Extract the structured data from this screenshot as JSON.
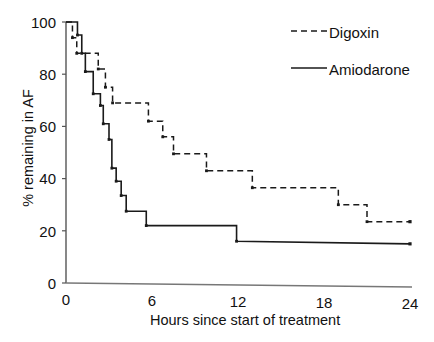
{
  "chart_data": {
    "type": "line",
    "subtype": "step-kaplan-meier",
    "title": "",
    "xlabel": "Hours since start of treatment",
    "ylabel": "% remaining in AF",
    "xlim": [
      0,
      24
    ],
    "ylim": [
      0,
      100
    ],
    "xticks": [
      0,
      6,
      12,
      18,
      24
    ],
    "xtick_labels": [
      "0",
      "6",
      "12",
      "18",
      "24"
    ],
    "yticks": [
      0,
      20,
      40,
      60,
      80,
      100
    ],
    "ytick_labels": [
      "0",
      "20",
      "40",
      "60",
      "80",
      "100"
    ],
    "grid": false,
    "legend_position": "top-right",
    "series": [
      {
        "name": "Digoxin",
        "style": "dashed",
        "color": "#1a1a1a",
        "x": [
          0.0,
          0.45,
          0.45,
          0.75,
          0.75,
          2.25,
          2.25,
          2.75,
          2.75,
          3.25,
          3.25,
          5.75,
          5.75,
          6.75,
          6.75,
          7.5,
          7.5,
          9.8,
          9.8,
          13.0,
          13.0,
          19.0,
          19.0,
          21.0,
          21.0,
          24.0
        ],
        "y": [
          100,
          100,
          94,
          94,
          88,
          88,
          82,
          82,
          75,
          75,
          69,
          69,
          62,
          62,
          56,
          56,
          49.5,
          49.5,
          43,
          43,
          36.5,
          36.5,
          30,
          30,
          23.5,
          23.5
        ]
      },
      {
        "name": "Amiodarone",
        "style": "solid",
        "color": "#1a1a1a",
        "x": [
          0.0,
          0.8,
          0.8,
          1.1,
          1.1,
          1.35,
          1.35,
          1.9,
          1.9,
          2.4,
          2.4,
          2.6,
          2.6,
          3.0,
          3.0,
          3.2,
          3.2,
          3.5,
          3.5,
          3.85,
          3.85,
          4.2,
          4.2,
          5.6,
          5.6,
          11.9,
          11.9,
          24.0
        ],
        "y": [
          100,
          100,
          95,
          95,
          88,
          88,
          81,
          81,
          72.5,
          72.5,
          68,
          68,
          61,
          61,
          55,
          55,
          44,
          44,
          39,
          39,
          33.5,
          33.5,
          27.5,
          27.5,
          22,
          22,
          16,
          15
        ]
      }
    ]
  },
  "axes": {
    "y_tick_labels": [
      "100",
      "80",
      "60",
      "40",
      "20",
      "0"
    ],
    "x_tick_labels": [
      "0",
      "6",
      "12",
      "18",
      "24"
    ],
    "x_axis_title": "Hours since start of treatment",
    "y_axis_title": "% remaining in AF"
  },
  "legend": {
    "entries": [
      {
        "label": "Digoxin",
        "style": "dashed"
      },
      {
        "label": "Amiodarone",
        "style": "solid"
      }
    ]
  }
}
